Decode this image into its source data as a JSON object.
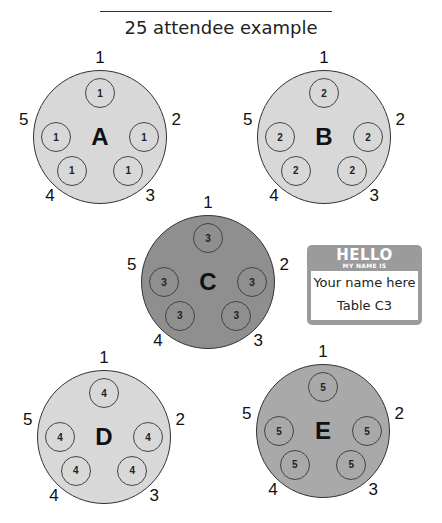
{
  "title": "25 attendee example",
  "tables": [
    {
      "letter": "A",
      "shade": "light",
      "color": "#d8d8d8",
      "cx": 100,
      "cy": 137,
      "seats": [
        "1",
        "1",
        "1",
        "1",
        "1"
      ],
      "positions": [
        "1",
        "2",
        "3",
        "4",
        "5"
      ]
    },
    {
      "letter": "B",
      "shade": "light",
      "color": "#d8d8d8",
      "cx": 324,
      "cy": 137,
      "seats": [
        "2",
        "2",
        "2",
        "2",
        "2"
      ],
      "positions": [
        "1",
        "2",
        "3",
        "4",
        "5"
      ]
    },
    {
      "letter": "C",
      "shade": "dark",
      "color": "#8f8f8f",
      "cx": 208,
      "cy": 282,
      "seats": [
        "3",
        "3",
        "3",
        "3",
        "3"
      ],
      "positions": [
        "1",
        "2",
        "3",
        "4",
        "5"
      ]
    },
    {
      "letter": "D",
      "shade": "light",
      "color": "#d8d8d8",
      "cx": 104,
      "cy": 437,
      "seats": [
        "4",
        "4",
        "4",
        "4",
        "4"
      ],
      "positions": [
        "1",
        "2",
        "3",
        "4",
        "5"
      ]
    },
    {
      "letter": "E",
      "shade": "mid",
      "color": "#a9a9a9",
      "cx": 323,
      "cy": 431,
      "seats": [
        "5",
        "5",
        "5",
        "5",
        "5"
      ],
      "positions": [
        "1",
        "2",
        "3",
        "4",
        "5"
      ]
    }
  ],
  "nametag": {
    "hello": "HELLO",
    "subtitle": "MY NAME IS",
    "name": "Your name here",
    "table": "Table C3",
    "color": "#9b9b9b"
  }
}
